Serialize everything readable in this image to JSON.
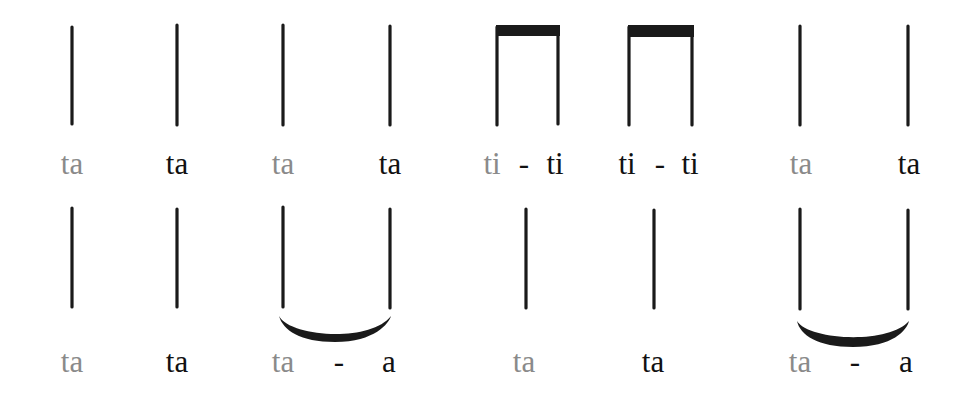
{
  "diagram": {
    "title": "",
    "colors": {
      "stroke": "#1a1a1a",
      "strong_beat_syllable": "#111111",
      "weak_beat_syllable": "#8a8a8a"
    },
    "rows": [
      {
        "notes": [
          {
            "type": "quarter",
            "stems": [
              72
            ],
            "syllables": [
              {
                "text": "ta",
                "shade": "gray"
              }
            ]
          },
          {
            "type": "quarter",
            "stems": [
              177
            ],
            "syllables": [
              {
                "text": "ta",
                "shade": "dark"
              }
            ]
          },
          {
            "type": "quarter",
            "stems": [
              283
            ],
            "syllables": [
              {
                "text": "ta",
                "shade": "gray"
              }
            ]
          },
          {
            "type": "quarter",
            "stems": [
              390
            ],
            "syllables": [
              {
                "text": "ta",
                "shade": "dark"
              }
            ]
          },
          {
            "type": "eighth-pair",
            "stems": [
              497,
              558
            ],
            "syllables": [
              {
                "text": "ti",
                "shade": "gray"
              },
              {
                "text": "-",
                "shade": "dash"
              },
              {
                "text": "ti",
                "shade": "dark"
              }
            ]
          },
          {
            "type": "eighth-pair",
            "stems": [
              629,
              692
            ],
            "syllables": [
              {
                "text": "ti",
                "shade": "dark"
              },
              {
                "text": "-",
                "shade": "dash"
              },
              {
                "text": "ti",
                "shade": "dark"
              }
            ]
          },
          {
            "type": "quarter",
            "stems": [
              800
            ],
            "syllables": [
              {
                "text": "ta",
                "shade": "gray"
              }
            ]
          },
          {
            "type": "quarter",
            "stems": [
              907
            ],
            "syllables": [
              {
                "text": "ta",
                "shade": "dark"
              }
            ]
          }
        ]
      },
      {
        "notes": [
          {
            "type": "quarter",
            "stems": [
              72
            ],
            "syllables": [
              {
                "text": "ta",
                "shade": "gray"
              }
            ]
          },
          {
            "type": "quarter",
            "stems": [
              177
            ],
            "syllables": [
              {
                "text": "ta",
                "shade": "dark"
              }
            ]
          },
          {
            "type": "tied-half",
            "stems": [
              283,
              390
            ],
            "syllables": [
              {
                "text": "ta",
                "shade": "gray"
              },
              {
                "text": "-",
                "shade": "dash"
              },
              {
                "text": "a",
                "shade": "dark"
              }
            ]
          },
          {
            "type": "quarter",
            "stems": [
              526
            ],
            "syllables": [
              {
                "text": "ta",
                "shade": "gray"
              }
            ]
          },
          {
            "type": "quarter",
            "stems": [
              654
            ],
            "syllables": [
              {
                "text": "ta",
                "shade": "dark"
              }
            ]
          },
          {
            "type": "tied-half",
            "stems": [
              800,
              908
            ],
            "syllables": [
              {
                "text": "ta",
                "shade": "gray"
              },
              {
                "text": "-",
                "shade": "dash"
              },
              {
                "text": "a",
                "shade": "dark"
              }
            ]
          }
        ]
      }
    ]
  },
  "labels": {
    "r1": {
      "n1": "ta",
      "n2": "ta",
      "n3": "ta",
      "n4": "ta",
      "n5a": "ti",
      "n5dash": "-",
      "n5b": "ti",
      "n6a": "ti",
      "n6dash": "-",
      "n6b": "ti",
      "n7": "ta",
      "n8": "ta"
    },
    "r2": {
      "n1": "ta",
      "n2": "ta",
      "n3a": "ta",
      "n3dash": "-",
      "n3b": "a",
      "n4": "ta",
      "n5": "ta",
      "n6a": "ta",
      "n6dash": "-",
      "n6b": "a"
    }
  }
}
